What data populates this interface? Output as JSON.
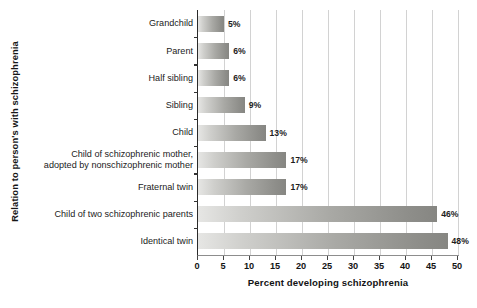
{
  "chart_data": {
    "type": "bar",
    "orientation": "horizontal",
    "title": "",
    "xlabel": "Percent developing schizophrenia",
    "ylabel": "Relation to person's with schizophrenia",
    "xlim": [
      0,
      50
    ],
    "xticks": [
      0,
      5,
      10,
      15,
      20,
      25,
      30,
      35,
      40,
      45,
      50
    ],
    "xtick_labels": [
      "0",
      "5",
      "10",
      "15",
      "20",
      "25",
      "30",
      "35",
      "40",
      "45",
      "50"
    ],
    "grid": "vertical",
    "legend": "none",
    "categories": [
      "Grandchild",
      "Parent",
      "Half sibling",
      "Sibling",
      "Child",
      "Child of schizophrenic mother,\nadopted by nonschizophrenic mother",
      "Fraternal twin",
      "Child of two schizophrenic parents",
      "Identical twin"
    ],
    "values": [
      5,
      6,
      6,
      9,
      13,
      17,
      17,
      46,
      48
    ],
    "value_labels": [
      "5%",
      "6%",
      "6%",
      "9%",
      "13%",
      "17%",
      "17%",
      "46%",
      "48%"
    ],
    "bar_fill_light": "#e6e6e4",
    "bar_fill_dark": "#868682",
    "gridline_color": "#d2d2d2",
    "axis_color": "#2a2a2a",
    "background": "#ffffff"
  }
}
